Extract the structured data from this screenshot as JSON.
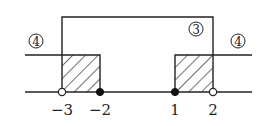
{
  "diagram": {
    "type": "number-line-solution-sets",
    "colors": {
      "line": "#222222",
      "hatch": "#222222",
      "open_point_fill": "#ffffff",
      "closed_point_fill": "#111111"
    },
    "number_line": {
      "ticks": [
        {
          "value": "-3",
          "label": "−3",
          "point": "open"
        },
        {
          "value": "-2",
          "label": "−2",
          "point": "closed"
        },
        {
          "value": "1",
          "label": "1",
          "point": "closed"
        },
        {
          "value": "2",
          "label": "2",
          "point": "open"
        }
      ]
    },
    "regions": [
      {
        "id": "3",
        "label": "③",
        "description": "interval from -3 to 2 (tall bracket)"
      },
      {
        "id": "4-left",
        "label": "④",
        "description": "rays beyond -2 to the left"
      },
      {
        "id": "4-right",
        "label": "④",
        "description": "rays beyond 1 to the right"
      }
    ],
    "shaded_intervals": [
      {
        "from": "-3",
        "to": "-2"
      },
      {
        "from": "1",
        "to": "2"
      }
    ]
  }
}
